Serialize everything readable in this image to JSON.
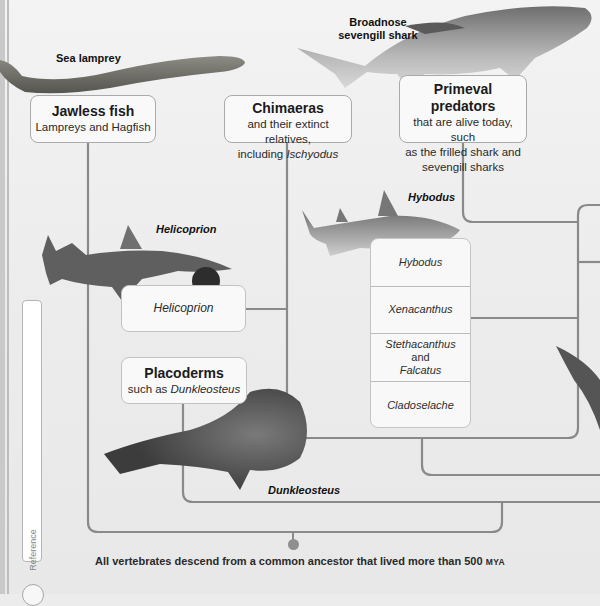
{
  "diagram": {
    "type": "phylogenetic-tree",
    "colors": {
      "background": "#ececec",
      "line": "#8a8a8a",
      "box_fill": "#f9f9f9",
      "box_border": "#a9a9a9",
      "node": "#8f8f8f"
    }
  },
  "creature_labels": {
    "sea_lamprey": "Sea lamprey",
    "broadnose_line1": "Broadnose",
    "broadnose_line2": "sevengill shark",
    "helicoprion": "Helicoprion",
    "hybodus": "Hybodus",
    "dunkleosteus": "Dunkleosteus"
  },
  "groups": {
    "jawless": {
      "title": "Jawless fish",
      "sub": "Lampreys and Hagfish"
    },
    "chimaeras": {
      "title": "Chimaeras",
      "sub_line1": "and their extinct relatives,",
      "sub_line2_prefix": "including ",
      "sub_line2_italic": "Ischyodus"
    },
    "primeval": {
      "title": "Primeval predators",
      "sub_line1": "that are alive today, such",
      "sub_line2": "as the frilled shark and",
      "sub_line3": "sevengill sharks"
    },
    "helicoprion_box": {
      "label": "Helicoprion"
    },
    "placoderms": {
      "title": "Placoderms",
      "sub_prefix": "such as ",
      "sub_italic": "Dunkleosteus"
    }
  },
  "shark_list": {
    "items": [
      {
        "label": "Hybodus"
      },
      {
        "label": "Xenacanthus"
      },
      {
        "label_italic": "Stethacanthus",
        "label_normal": " and",
        "label_line2": "Falcatus"
      },
      {
        "label": "Cladoselache"
      }
    ]
  },
  "sidebar": {
    "tab_label": "Reference"
  },
  "footer": {
    "text": "All vertebrates descend from a common ancestor that lived more than 500 ",
    "unit": "MYA"
  }
}
